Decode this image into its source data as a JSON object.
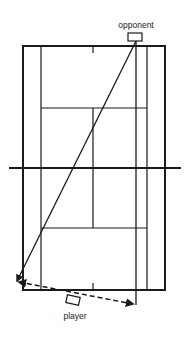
{
  "diagram": {
    "labels": {
      "opponent": "opponent",
      "player": "player"
    },
    "colors": {
      "line": "#1a1a1a",
      "background": "#ffffff"
    },
    "court": {
      "outer": {
        "x1": 23,
        "y1": 46,
        "x2": 165,
        "y2": 290
      },
      "singles_left_x": 41,
      "singles_right_x": 147,
      "center_x": 93,
      "service_line_top_y": 108,
      "service_line_bottom_y": 228,
      "net": {
        "y": 168,
        "x1": 9,
        "x2": 181
      },
      "center_mark_length": 7
    },
    "opponent": {
      "box": {
        "x": 128,
        "y": 33,
        "w": 14,
        "h": 8
      },
      "label_pos": {
        "x": 136,
        "y": 20
      }
    },
    "player": {
      "box": {
        "cx": 73,
        "cy": 300,
        "w": 13,
        "h": 8,
        "rotate": 12
      },
      "label_pos": {
        "x": 75,
        "y": 311
      }
    },
    "shots": [
      {
        "name": "opponent-crosscourt-shot",
        "style": "solid",
        "from": [
          136,
          41
        ],
        "to": [
          17,
          281
        ]
      },
      {
        "name": "opponent-straight-shot",
        "style": "solid",
        "from": [
          136,
          41
        ],
        "to": [
          136,
          305
        ]
      },
      {
        "name": "player-run-path",
        "style": "dashed",
        "from": [
          19,
          282
        ],
        "to": [
          133,
          304
        ]
      }
    ]
  }
}
